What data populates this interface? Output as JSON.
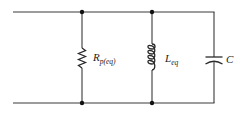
{
  "diagram": {
    "type": "parallel RLC circuit",
    "colors": {
      "wire": "#3a3a3a",
      "component": "#2a2a2a",
      "node": "#111111",
      "background": "#ffffff"
    },
    "components": [
      {
        "id": "resistor",
        "symbol": "resistor-zigzag",
        "label_main": "R",
        "label_sub": "p(eq)"
      },
      {
        "id": "inductor",
        "symbol": "inductor-coil",
        "label_main": "L",
        "label_sub": "eq"
      },
      {
        "id": "capacitor",
        "symbol": "capacitor-curved-plate",
        "label_main": "C",
        "label_sub": ""
      }
    ],
    "nodes": [
      {
        "id": "top-node-1"
      },
      {
        "id": "top-node-2"
      },
      {
        "id": "bottom-node-1"
      },
      {
        "id": "bottom-node-2"
      }
    ]
  }
}
